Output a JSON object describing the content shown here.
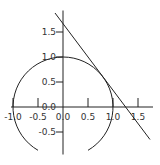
{
  "chart_data": {
    "type": "line",
    "title": "",
    "xlabel": "",
    "ylabel": "",
    "xlim": [
      -1.0,
      1.8
    ],
    "ylim": [
      -0.95,
      1.93
    ],
    "grid": false,
    "legend": null,
    "axes_through_origin": true,
    "x_ticks": [
      -1.0,
      -0.5,
      0.0,
      0.5,
      1.0,
      1.5
    ],
    "x_tick_labels": [
      "-1.0",
      "-0.5",
      "0.0",
      "0.5",
      "1.0",
      "1.5"
    ],
    "y_ticks": [
      -0.5,
      0.0,
      0.5,
      1.0,
      1.5
    ],
    "y_tick_labels": [
      "-0.5",
      "0.0",
      "0.5",
      "1.0",
      "1.5"
    ],
    "series": [
      {
        "name": "unit circle arc",
        "kind": "arc",
        "center": [
          0,
          0
        ],
        "radius": 1.0,
        "start_angle_deg": -60,
        "end_angle_deg": 240,
        "color": "#222222"
      },
      {
        "name": "tangent line",
        "kind": "line",
        "equation": "0.8x + 0.6y = 1",
        "x": [
          -0.16,
          1.74
        ],
        "y": [
          1.88,
          -0.65
        ],
        "tangent_point": [
          0.8,
          0.6
        ],
        "color": "#222222"
      }
    ]
  },
  "style": {
    "axis_color": "#222222",
    "label_color": "#333333"
  }
}
